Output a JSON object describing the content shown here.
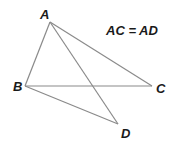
{
  "diagram": {
    "type": "geometry",
    "equation": "AC = AD",
    "points": [
      {
        "name": "A",
        "x": 50,
        "y": 22,
        "lx": 40,
        "ly": 19
      },
      {
        "name": "B",
        "x": 25,
        "y": 86,
        "lx": 13,
        "ly": 91
      },
      {
        "name": "C",
        "x": 152,
        "y": 86,
        "lx": 156,
        "ly": 93
      },
      {
        "name": "D",
        "x": 118,
        "y": 124,
        "lx": 121,
        "ly": 138
      }
    ],
    "segments": [
      {
        "from": "A",
        "to": "B"
      },
      {
        "from": "A",
        "to": "C"
      },
      {
        "from": "A",
        "to": "D"
      },
      {
        "from": "B",
        "to": "C"
      },
      {
        "from": "B",
        "to": "D"
      }
    ],
    "line_color": "#8a8a8a",
    "label_color": "#1a1a1a"
  }
}
